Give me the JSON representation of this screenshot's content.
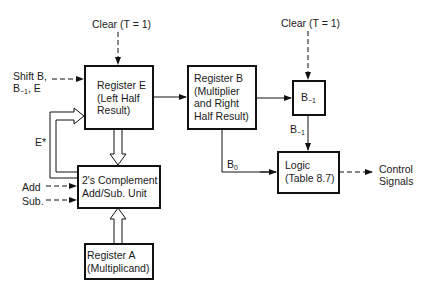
{
  "diagram": {
    "blocks": {
      "register_e": {
        "line1": "Register E",
        "line2": "(Left Half",
        "line3": "Result)"
      },
      "register_b": {
        "line1": "Register B",
        "line2": "(Multiplier",
        "line3": "and Right",
        "line4": "Half Result)"
      },
      "b_minus1": {
        "base": "B",
        "sub": "−1"
      },
      "logic": {
        "line1": "Logic",
        "line2": "(Table 8.7)"
      },
      "adder": {
        "line1": "2's Complement",
        "line2": "Add/Sub. Unit"
      },
      "register_a": {
        "line1": "Register A",
        "line2": "(Multiplicand)"
      }
    },
    "labels": {
      "clear_left": "Clear (T = 1)",
      "clear_right": "Clear (T = 1)",
      "shift_line1": "Shift B,",
      "shift_b": "B",
      "shift_sub": "−1",
      "shift_rest": ", E",
      "e_star": "E*",
      "add": "Add",
      "sub": "Sub.",
      "b_minus1_out_base": "B",
      "b_minus1_out_sub": "−1",
      "b0_base": "B",
      "b0_sub": "0",
      "control_line1": "Control",
      "control_line2": "Signals"
    }
  }
}
